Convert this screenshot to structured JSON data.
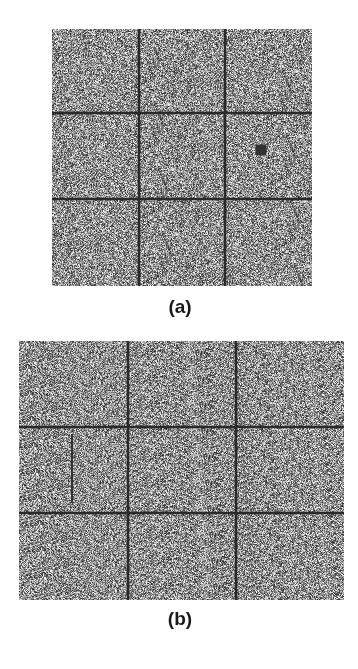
{
  "figure": {
    "panels": [
      {
        "id": "a",
        "label": "(a)",
        "box": {
          "x": 52,
          "y": 29,
          "w": 260,
          "h": 257
        },
        "grid_v": [
          87,
          173
        ],
        "grid_h": [
          84,
          170
        ],
        "markers": [
          {
            "type": "square",
            "x": 209,
            "y": 121,
            "size": 11
          }
        ],
        "segments": [],
        "label_pos": {
          "x": 140,
          "y": 296
        }
      },
      {
        "id": "b",
        "label": "(b)",
        "box": {
          "x": 19,
          "y": 341,
          "w": 325,
          "h": 259
        },
        "grid_v": [
          109,
          217
        ],
        "grid_h": [
          86,
          172
        ],
        "markers": [],
        "segments": [
          {
            "x1": 53,
            "y1": 93,
            "x2": 53,
            "y2": 162
          }
        ],
        "label_pos": {
          "x": 140,
          "y": 608
        }
      }
    ],
    "colors": {
      "noise_base": "#7a7a7a",
      "grid_line": "#2a2a2a",
      "label_text": "#1a1a1a",
      "background": "#ffffff"
    }
  }
}
